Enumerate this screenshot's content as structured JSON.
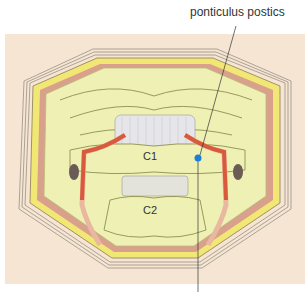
{
  "labels": {
    "top_callout": "ponticulus postics",
    "vertebra_c1": "C1",
    "vertebra_c2": "C2"
  },
  "colors": {
    "background_skin": "#f6e5d3",
    "bone": "#eef0b4",
    "bone_shadow": "#d6dc8e",
    "fat": "#f1e774",
    "muscle": "#d9a08c",
    "artery": "#d9593c",
    "vein_pale": "#e8b9a0",
    "ligament": "#e6e6ea",
    "marker": "#1d7fd6",
    "outline": "#7a7a5a"
  }
}
